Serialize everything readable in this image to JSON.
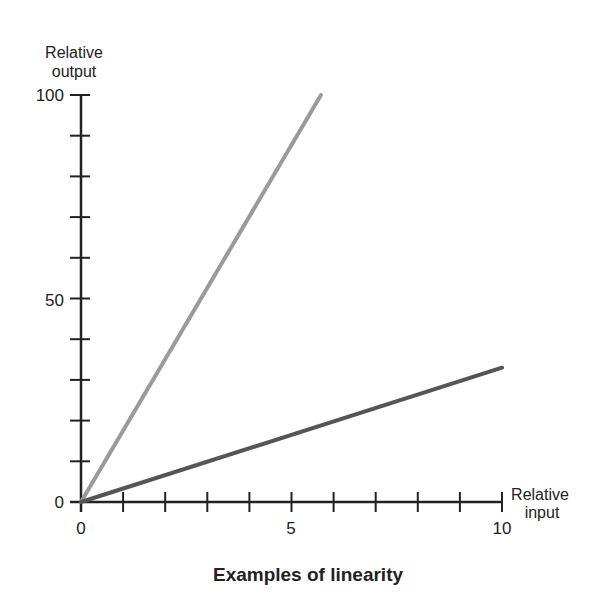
{
  "chart_data": {
    "type": "line",
    "title": "Examples of linearity",
    "xlabel": "Relative input",
    "ylabel": "Relative output",
    "xlim": [
      0,
      10
    ],
    "ylim": [
      0,
      100
    ],
    "x_major_ticks": [
      0,
      5,
      10
    ],
    "x_minor_tick_step": 1,
    "y_major_ticks": [
      0,
      50,
      100
    ],
    "y_minor_tick_step": 10,
    "grid": false,
    "legend": null,
    "series": [
      {
        "name": "steep linear relation",
        "color": "#9a9a9a",
        "x": [
          0,
          5.7
        ],
        "y": [
          0,
          100
        ]
      },
      {
        "name": "shallow linear relation",
        "color": "#555555",
        "x": [
          0,
          10
        ],
        "y": [
          0,
          33
        ]
      }
    ]
  },
  "labels": {
    "y_axis_line1": "Relative",
    "y_axis_line2": "output",
    "x_axis_line1": "Relative",
    "x_axis_line2": "input",
    "x_tick_0": "0",
    "x_tick_5": "5",
    "x_tick_10": "10",
    "y_tick_0": "0",
    "y_tick_50": "50",
    "y_tick_100": "100",
    "title": "Examples of linearity"
  }
}
